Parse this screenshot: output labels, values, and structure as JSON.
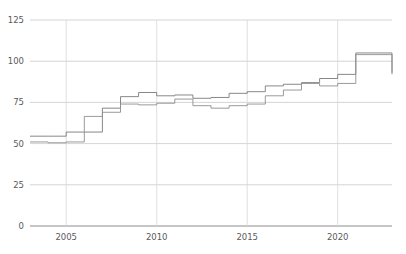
{
  "chart_data": {
    "type": "line",
    "line_style": "step-post",
    "title": "",
    "subtitle": "",
    "xlabel": "",
    "ylabel": "",
    "xlim": [
      2003,
      2023
    ],
    "ylim": [
      0,
      125
    ],
    "grid": true,
    "legend": "none",
    "y_ticks": [
      0,
      25,
      50,
      75,
      100,
      125
    ],
    "y_tick_labels": [
      "0",
      "25",
      "50",
      "75",
      "100",
      "125"
    ],
    "x_ticks": [
      2005,
      2010,
      2015,
      2020
    ],
    "x_tick_labels": [
      "2005",
      "2010",
      "2015",
      "2020"
    ],
    "x": [
      2003,
      2004,
      2005,
      2006,
      2007,
      2008,
      2009,
      2010,
      2011,
      2012,
      2013,
      2014,
      2015,
      2016,
      2017,
      2018,
      2019,
      2020,
      2021,
      2022,
      2023
    ],
    "series": [
      {
        "name": "series-1",
        "color": "#7a7a7a",
        "values": [
          54.5,
          54.5,
          57.0,
          57.0,
          71.5,
          78.5,
          81.0,
          79.0,
          79.5,
          77.5,
          78.0,
          80.5,
          81.5,
          85.0,
          86.0,
          87.0,
          89.5,
          92.0,
          105.0,
          105.0,
          93.0
        ]
      },
      {
        "name": "series-2",
        "color": "#8e8e8e",
        "values": [
          51.0,
          50.5,
          51.0,
          66.5,
          69.0,
          74.0,
          73.5,
          74.5,
          77.0,
          73.0,
          71.5,
          73.0,
          74.0,
          79.0,
          82.5,
          86.5,
          85.0,
          86.5,
          104.0,
          104.0,
          92.0
        ]
      }
    ]
  },
  "axes": {
    "plot_left": 30,
    "plot_right": 392,
    "plot_top": 20,
    "plot_bottom": 226
  },
  "colors": {
    "background": "#ffffff",
    "gridline_horizontal": "#c9c9c9",
    "gridline_vertical": "#d8d8d8",
    "axis_baseline": "#8c8c8c",
    "tick_text": "#5a5a5a"
  }
}
